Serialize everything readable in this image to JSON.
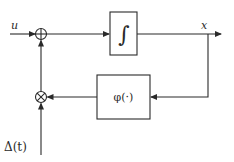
{
  "diagram": {
    "type": "block-diagram",
    "nodes": {
      "input": {
        "label": "u"
      },
      "sum_junction": {
        "symbol": "⊕"
      },
      "integrator": {
        "label": "∫"
      },
      "output": {
        "label": "x"
      },
      "nonlinearity": {
        "label": "φ(·)"
      },
      "multiplier": {
        "symbol": "⊗"
      },
      "disturbance": {
        "label": "Δ(t)"
      }
    },
    "edges": [
      {
        "from": "input",
        "to": "sum_junction"
      },
      {
        "from": "sum_junction",
        "to": "integrator"
      },
      {
        "from": "integrator",
        "to": "output"
      },
      {
        "from": "output",
        "to": "nonlinearity"
      },
      {
        "from": "nonlinearity",
        "to": "multiplier"
      },
      {
        "from": "disturbance",
        "to": "multiplier"
      },
      {
        "from": "multiplier",
        "to": "sum_junction"
      }
    ]
  }
}
